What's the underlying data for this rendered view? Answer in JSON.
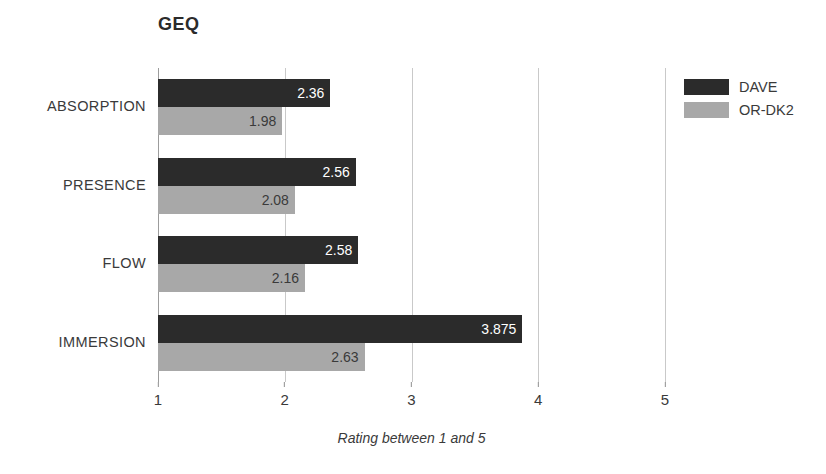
{
  "chart_data": {
    "type": "bar",
    "orientation": "horizontal",
    "title": "GEQ",
    "xlabel": "Rating between 1 and 5",
    "ylabel": "",
    "xlim": [
      1,
      5
    ],
    "xticks": [
      "1",
      "2",
      "3",
      "4",
      "5"
    ],
    "grid": true,
    "legend_position": "top-right",
    "categories": [
      "ABSORPTION",
      "PRESENCE",
      "FLOW",
      "IMMERSION"
    ],
    "series": [
      {
        "name": "DAVE",
        "color": "#2b2b2b",
        "values": [
          2.36,
          2.56,
          2.58,
          3.875
        ],
        "labels": [
          "2.36",
          "2.56",
          "2.58",
          "3.875"
        ]
      },
      {
        "name": "OR-DK2",
        "color": "#a8a8a8",
        "values": [
          1.98,
          2.08,
          2.16,
          2.63
        ],
        "labels": [
          "1.98",
          "2.08",
          "2.16",
          "2.63"
        ]
      }
    ]
  },
  "legend": {
    "items": [
      {
        "label": "DAVE",
        "swatch": "legend-swatch-dave"
      },
      {
        "label": "OR-DK2",
        "swatch": "legend-swatch-ordk2"
      }
    ]
  }
}
